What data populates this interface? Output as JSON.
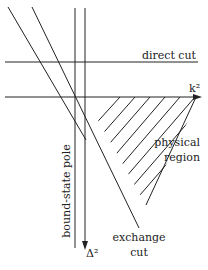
{
  "diagram": {
    "labels": {
      "direct_cut": "direct cut",
      "k2_axis": "k²",
      "physical_region_line1": "physical",
      "physical_region_line2": "region",
      "bound_state_pole": "bound-state pole",
      "delta2_axis": "Δ²",
      "exchange_cut_line1": "exchange",
      "exchange_cut_line2": "cut"
    },
    "colors": {
      "line": "#222222",
      "background": "#ffffff"
    }
  }
}
